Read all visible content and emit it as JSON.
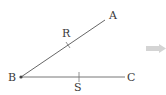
{
  "diagram": {
    "points": {
      "A": {
        "label": "A",
        "x": 105,
        "y": 20
      },
      "B": {
        "label": "B",
        "x": 21,
        "y": 77
      },
      "C": {
        "label": "C",
        "x": 125,
        "y": 77
      },
      "R": {
        "label": "R",
        "x": 68,
        "y": 45
      },
      "S": {
        "label": "S",
        "x": 79,
        "y": 77
      }
    },
    "segments": [
      {
        "from": "B",
        "to": "A",
        "tick_at": "R"
      },
      {
        "from": "B",
        "to": "C",
        "tick_at": "S"
      }
    ],
    "colors": {
      "line": "#555555",
      "label": "#3a3a3a",
      "arrow": "#d4d4d4"
    },
    "arrow_icon": "right-arrow-icon"
  }
}
